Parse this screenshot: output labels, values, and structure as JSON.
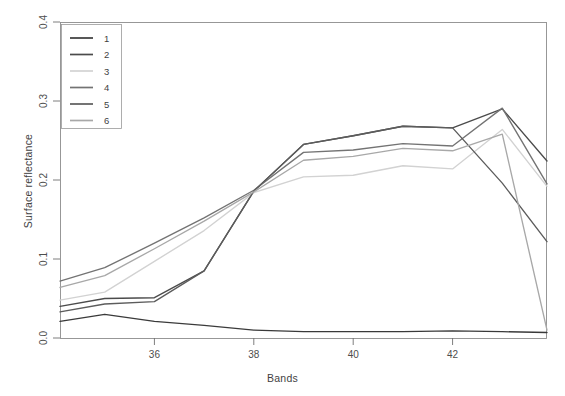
{
  "figure": {
    "title_clipped": "",
    "background_color": "#ffffff"
  },
  "axes": {
    "xlabel": "Bands",
    "ylabel": "Surface reflectance",
    "x_ticks": [
      "36",
      "38",
      "40",
      "42"
    ],
    "y_ticks": [
      "0.0",
      "0.1",
      "0.2",
      "0.3",
      "0.4"
    ]
  },
  "legend": {
    "entries": [
      {
        "label": "1",
        "color": "#3a3a3a"
      },
      {
        "label": "2",
        "color": "#4b4b4b"
      },
      {
        "label": "3",
        "color": "#d2d2d2"
      },
      {
        "label": "4",
        "color": "#737373"
      },
      {
        "label": "5",
        "color": "#5c5c5c"
      },
      {
        "label": "6",
        "color": "#a8a8a8"
      }
    ]
  },
  "chart_data": {
    "type": "line",
    "title": "",
    "xlabel": "Bands",
    "ylabel": "Surface reflectance",
    "xlim": [
      34.1,
      43.9
    ],
    "ylim": [
      0.0,
      0.4
    ],
    "x_ticks": [
      36,
      38,
      40,
      42
    ],
    "y_ticks": [
      0.0,
      0.1,
      0.2,
      0.3,
      0.4
    ],
    "grid": false,
    "legend_position": "top-left",
    "x": [
      34.1,
      35,
      36,
      37,
      38,
      39,
      40,
      41,
      42,
      43,
      43.9
    ],
    "series": [
      {
        "name": "1",
        "color": "#3a3a3a",
        "values": [
          0.021,
          0.03,
          0.021,
          0.016,
          0.01,
          0.008,
          0.008,
          0.008,
          0.009,
          0.008,
          0.007
        ]
      },
      {
        "name": "2",
        "color": "#4b4b4b",
        "values": [
          0.04,
          0.05,
          0.051,
          0.085,
          0.186,
          0.245,
          0.256,
          0.268,
          0.266,
          0.29,
          0.224
        ]
      },
      {
        "name": "3",
        "color": "#d2d2d2",
        "values": [
          0.048,
          0.058,
          0.097,
          0.136,
          0.184,
          0.204,
          0.206,
          0.218,
          0.214,
          0.264,
          0.192
        ]
      },
      {
        "name": "4",
        "color": "#737373",
        "values": [
          0.072,
          0.089,
          0.12,
          0.152,
          0.187,
          0.235,
          0.238,
          0.246,
          0.243,
          0.291,
          0.195
        ]
      },
      {
        "name": "5",
        "color": "#5c5c5c",
        "values": [
          0.033,
          0.043,
          0.046,
          0.085,
          0.186,
          0.245,
          0.256,
          0.268,
          0.266,
          0.196,
          0.122
        ]
      },
      {
        "name": "6",
        "color": "#a8a8a8",
        "values": [
          0.064,
          0.079,
          0.113,
          0.148,
          0.185,
          0.225,
          0.23,
          0.24,
          0.237,
          0.258,
          0.01
        ]
      }
    ]
  },
  "plot_geometry": {
    "left": 60,
    "right": 547,
    "top": 22,
    "bottom": 338
  }
}
